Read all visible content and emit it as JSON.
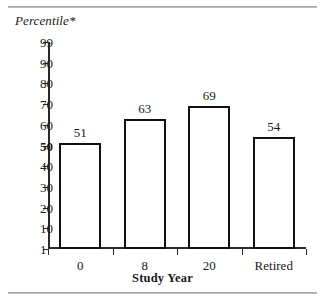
{
  "figure": {
    "top_rule": "",
    "bottom_rule": ""
  },
  "chart_data": {
    "type": "bar",
    "title": "",
    "categories": [
      "0",
      "8",
      "20",
      "Retired"
    ],
    "values": [
      51,
      63,
      69,
      54
    ],
    "data_labels": [
      "51",
      "63",
      "69",
      "54"
    ],
    "xlabel": "Study Year",
    "ylabel": "Percentile*",
    "ylim": [
      1,
      99
    ],
    "ytick_values": [
      99,
      90,
      80,
      70,
      60,
      50,
      40,
      30,
      20,
      10,
      1
    ],
    "ytick_labels": [
      "99",
      "90",
      "80",
      "70",
      "60",
      "50",
      "40",
      "30",
      "20",
      "10",
      "1"
    ],
    "ytick_emphasis": [
      false,
      false,
      false,
      false,
      false,
      true,
      false,
      false,
      false,
      false,
      false
    ],
    "grid": false,
    "legend": null,
    "bar_fill": "#ffffff",
    "bar_edge": "#111111",
    "axis_color": "#2a2a2a",
    "scale_note": "probit-like percentile axis"
  }
}
